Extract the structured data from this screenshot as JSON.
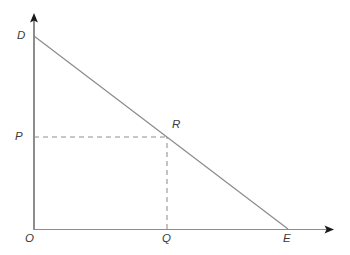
{
  "figure": {
    "kind": "line",
    "background_color": "#ffffff",
    "width": 350,
    "height": 255
  },
  "chart_data": {
    "type": "line",
    "title": "",
    "subtitle": "",
    "xlabel": "",
    "ylabel": "",
    "grid": false,
    "legend": null,
    "xlim": [
      0,
      350
    ],
    "ylim": [
      0,
      255
    ],
    "axes": {
      "x_axis": {
        "label": "",
        "start": [
          34,
          229
        ],
        "end": [
          333,
          229
        ],
        "arrow": "right",
        "color": "#8d8d8d"
      },
      "y_axis": {
        "label": "",
        "start": [
          34,
          229
        ],
        "end": [
          34,
          14
        ],
        "arrow": "up",
        "color": "#8d8d8d"
      }
    },
    "series": [
      {
        "name": "DE",
        "style": "solid",
        "color": "#8a8a8a",
        "points": [
          [
            34,
            36
          ],
          [
            288,
            229
          ]
        ]
      },
      {
        "name": "PR",
        "style": "dashed",
        "color": "#8f8f8f",
        "points": [
          [
            34,
            137
          ],
          [
            167,
            137
          ]
        ]
      },
      {
        "name": "QR",
        "style": "dashed",
        "color": "#8f8f8f",
        "points": [
          [
            167,
            229
          ],
          [
            167,
            137
          ]
        ]
      }
    ],
    "annotations": [
      {
        "id": "D",
        "text": "D",
        "point": [
          34,
          36
        ],
        "label_x": 17,
        "label_y": 30,
        "role": "line-endpoint-on-y-axis"
      },
      {
        "id": "P",
        "text": "P",
        "point": [
          34,
          137
        ],
        "label_x": 15,
        "label_y": 131,
        "role": "price-on-y-axis"
      },
      {
        "id": "R",
        "text": "R",
        "point": [
          167,
          137
        ],
        "label_x": 172,
        "label_y": 119,
        "role": "point-on-line"
      },
      {
        "id": "O",
        "text": "O",
        "point": [
          34,
          229
        ],
        "label_x": 25,
        "label_y": 233,
        "role": "origin"
      },
      {
        "id": "Q",
        "text": "Q",
        "point": [
          167,
          229
        ],
        "label_x": 162,
        "label_y": 233,
        "role": "quantity-on-x-axis"
      },
      {
        "id": "E",
        "text": "E",
        "point": [
          288,
          229
        ],
        "label_x": 283,
        "label_y": 233,
        "role": "line-endpoint-on-x-axis"
      }
    ]
  }
}
